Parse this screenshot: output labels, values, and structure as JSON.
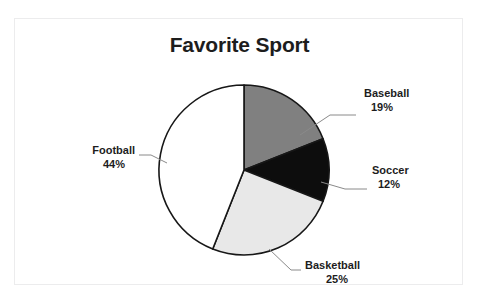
{
  "page": {
    "background_color": "#ffffff",
    "frame_border_color": "#ececed",
    "top_text_remnant": "                                                                     "
  },
  "chart_data": {
    "type": "pie",
    "title": "Favorite Sport",
    "xlabel": "",
    "ylabel": "",
    "legend_position": "none",
    "labels_position": "outside-with-leader-lines",
    "grid": false,
    "start_angle_deg": 0,
    "direction": "clockwise",
    "categories": [
      "Baseball",
      "Soccer",
      "Basketball",
      "Football"
    ],
    "values": [
      19,
      12,
      25,
      44
    ],
    "value_suffix": "%",
    "colors": [
      "#808080",
      "#0d0d0d",
      "#e8e8e8",
      "#ffffff"
    ],
    "slice_outline_color": "#171717",
    "slices": [
      {
        "name": "Baseball",
        "value": 19,
        "label": "Baseball",
        "value_label": "19%",
        "color": "#808080",
        "label_x": 349,
        "label_y": 78,
        "pct_x": 349,
        "pct_y": 92,
        "leader": "M 285 116 L 315 96 L 341 96"
      },
      {
        "name": "Soccer",
        "value": 12,
        "label": "Soccer",
        "value_label": "12%",
        "color": "#0d0d0d",
        "label_x": 358,
        "label_y": 152,
        "pct_x": 358,
        "pct_y": 166,
        "leader": "M 306 163 L 330 170 L 352 170"
      },
      {
        "name": "Basketball",
        "value": 25,
        "label": "Basketball",
        "value_label": "25%",
        "color": "#e8e8e8",
        "label_x": 290,
        "label_y": 249,
        "pct_x": 303,
        "pct_y": 263,
        "leader": "M 254 230 L 276 251 L 286 251"
      },
      {
        "name": "Football",
        "value": 44,
        "label": "Football",
        "value_label": "44%",
        "color": "#ffffff",
        "label_x": 82,
        "label_y": 132,
        "pct_x": 105,
        "pct_y": 146,
        "leader": "M 152 144 L 136 136 L 124 136"
      }
    ]
  }
}
